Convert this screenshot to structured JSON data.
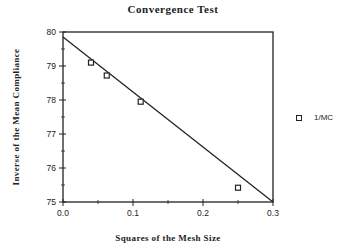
{
  "chart_data": {
    "type": "scatter",
    "title": "Convergence Test",
    "xlabel": "Squares of the Mesh Size",
    "ylabel": "Inverse of the Mean Compliance",
    "xlim": [
      0.0,
      0.3
    ],
    "ylim": [
      75,
      80
    ],
    "x_ticks": [
      "0.0",
      "0.1",
      "0.2",
      "0.3"
    ],
    "y_ticks": [
      "75",
      "76",
      "77",
      "78",
      "79",
      "80"
    ],
    "grid": false,
    "legend_position": "right",
    "series": [
      {
        "name": "1/MC",
        "marker": "square",
        "x": [
          0.04,
          0.0625,
          0.111,
          0.25
        ],
        "y": [
          79.1,
          78.72,
          77.95,
          75.42
        ]
      }
    ],
    "fit_line": {
      "x": [
        0.0,
        0.3
      ],
      "y": [
        79.85,
        75.0
      ]
    }
  },
  "title": "Convergence Test",
  "xlabel": "Squares of the Mesh Size",
  "ylabel": "Inverse of the Mean Compliance",
  "legend": {
    "label": "1/MC"
  }
}
